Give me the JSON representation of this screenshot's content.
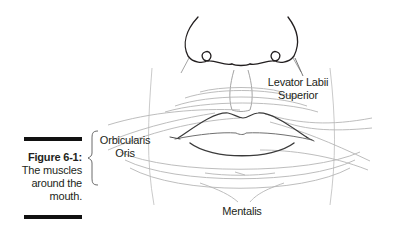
{
  "figure": {
    "number_label": "Figure 6-1:",
    "caption_lines": [
      "The muscles",
      "around the",
      "mouth."
    ]
  },
  "labels": {
    "levator": [
      "Levator Labii",
      "Superior"
    ],
    "orbicularis": [
      "Orbicularis",
      "Oris"
    ],
    "mentalis": "Mentalis"
  },
  "colors": {
    "ink": "#231f20",
    "muscle_line": "#b5b5b5",
    "bar": "#111111"
  }
}
